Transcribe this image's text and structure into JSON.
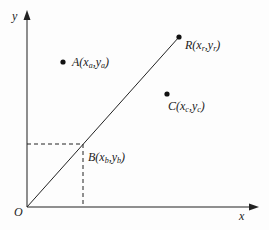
{
  "diagram": {
    "type": "coordinate-geometry",
    "axes": {
      "x_label": "x",
      "y_label": "y",
      "origin_label": "O",
      "color": "#333333"
    },
    "line": {
      "from": "O",
      "to": "R",
      "color": "#222222"
    },
    "points": [
      {
        "id": "A",
        "name": "A",
        "x_sub": "a",
        "y_sub": "a",
        "label": "A(xa,ya)"
      },
      {
        "id": "R",
        "name": "R",
        "x_sub": "r",
        "y_sub": "r",
        "label": "R(xr,yr)"
      },
      {
        "id": "C",
        "name": "C",
        "x_sub": "c",
        "y_sub": "c",
        "label": "C(xc,yc)"
      },
      {
        "id": "B",
        "name": "B",
        "x_sub": "b",
        "y_sub": "b",
        "label": "B(xb,yb)"
      }
    ],
    "projections": {
      "point": "B",
      "style": "dashed",
      "to_axes": [
        "x",
        "y"
      ]
    }
  }
}
